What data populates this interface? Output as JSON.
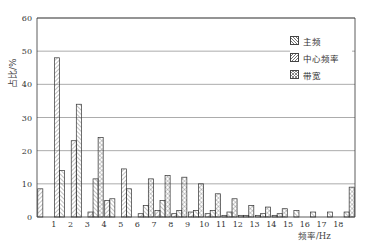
{
  "chart_data": {
    "type": "bar",
    "title": "",
    "xlabel": "频率/Hz",
    "ylabel": "占比/%",
    "ylim": [
      0,
      60
    ],
    "yticks": [
      0,
      10,
      20,
      30,
      40,
      50,
      60
    ],
    "grid": true,
    "legend_position": "upper right",
    "categories": [
      "<1",
      "1",
      "2",
      "3",
      "4",
      "5",
      "6",
      "7",
      "8",
      "9",
      "10",
      "11",
      "12",
      "13",
      "14",
      "15",
      "16",
      "17",
      ">18"
    ],
    "xtick_labels": [
      "1",
      "2",
      "3",
      "4",
      "5",
      "6",
      "7",
      "8",
      "9",
      "10",
      "11",
      "12",
      "13",
      "14",
      "15",
      "16",
      "17",
      "18"
    ],
    "series": [
      {
        "name": "主频",
        "pattern": "diag-forward",
        "values": [
          8.5,
          48,
          23,
          1.5,
          5,
          14.5,
          1,
          2,
          1,
          1.5,
          1,
          0.5,
          0.5,
          0.5,
          0.5,
          0,
          0,
          0,
          0
        ]
      },
      {
        "name": "中心频率",
        "pattern": "diag-back",
        "values": [
          0,
          14,
          34,
          11.5,
          5.5,
          8.5,
          3.5,
          5,
          2,
          2,
          2,
          1.5,
          0.5,
          1,
          1,
          2,
          1.5,
          1.5,
          1.5
        ]
      },
      {
        "name": "带宽",
        "pattern": "cross",
        "values": [
          0,
          0,
          0,
          24,
          0,
          0,
          11.5,
          12.5,
          12,
          10,
          7,
          5.5,
          3.5,
          3,
          2.5,
          0,
          0,
          0,
          9
        ]
      }
    ]
  },
  "legend": {
    "items": [
      {
        "label": "主频"
      },
      {
        "label": "中心频率"
      },
      {
        "label": "带宽"
      }
    ]
  },
  "axes": {
    "ylabel": "占比/%",
    "xlabel": "频率/Hz"
  }
}
